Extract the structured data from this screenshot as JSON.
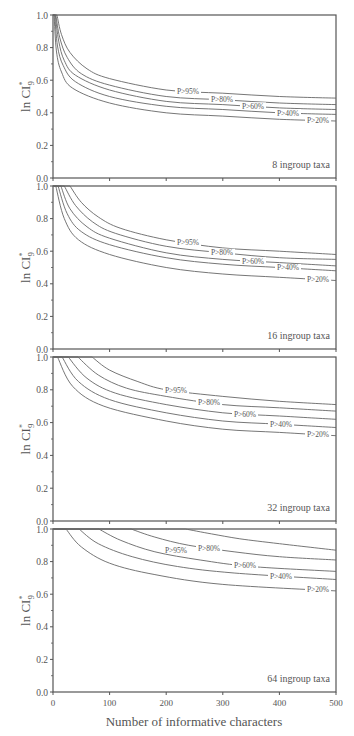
{
  "chart_data": {
    "type": "line",
    "title": "",
    "xlabel": "Number of informative characters",
    "ylabel": "ln CI*9",
    "ylabel_parts": {
      "main": "ln CI",
      "sup": "*",
      "sub": "9"
    },
    "xlim": [
      0,
      500
    ],
    "ylim": [
      0.0,
      1.0
    ],
    "x_ticks": [
      0,
      100,
      200,
      300,
      400,
      500
    ],
    "x_tick_labels": [
      "0",
      "100",
      "200",
      "300",
      "400",
      "500"
    ],
    "y_ticks": [
      0.0,
      0.2,
      0.4,
      0.6,
      0.8,
      1.0
    ],
    "y_tick_labels": [
      "0.0",
      "0.2",
      "0.4",
      "0.6",
      "0.8",
      "1.0"
    ],
    "grid": false,
    "legend_position": "inline labels near right end of curves",
    "panels": [
      {
        "annotation": "8 ingroup taxa",
        "series": [
          {
            "name": "P>95%",
            "x": [
              7,
              15,
              30,
              60,
              100,
              200,
              300,
              400,
              500
            ],
            "values": [
              1.0,
              0.88,
              0.77,
              0.67,
              0.61,
              0.54,
              0.52,
              0.5,
              0.49
            ]
          },
          {
            "name": "P>80%",
            "x": [
              5,
              12,
              25,
              50,
              100,
              200,
              300,
              400,
              500
            ],
            "values": [
              1.0,
              0.86,
              0.74,
              0.64,
              0.57,
              0.5,
              0.48,
              0.46,
              0.45
            ]
          },
          {
            "name": "P>60%",
            "x": [
              4,
              10,
              20,
              40,
              100,
              200,
              300,
              400,
              500
            ],
            "values": [
              1.0,
              0.84,
              0.72,
              0.63,
              0.54,
              0.47,
              0.45,
              0.43,
              0.42
            ]
          },
          {
            "name": "P>40%",
            "x": [
              3,
              8,
              18,
              40,
              100,
              200,
              300,
              400,
              500
            ],
            "values": [
              1.0,
              0.81,
              0.69,
              0.59,
              0.5,
              0.44,
              0.42,
              0.4,
              0.39
            ]
          },
          {
            "name": "P>20%",
            "x": [
              2,
              6,
              15,
              35,
              100,
              200,
              300,
              400,
              500
            ],
            "values": [
              1.0,
              0.78,
              0.65,
              0.55,
              0.46,
              0.4,
              0.38,
              0.36,
              0.35
            ]
          }
        ]
      },
      {
        "annotation": "16 ingroup taxa",
        "series": [
          {
            "name": "P>95%",
            "x": [
              30,
              50,
              80,
              120,
              200,
              300,
              400,
              500
            ],
            "values": [
              1.0,
              0.9,
              0.81,
              0.74,
              0.67,
              0.62,
              0.6,
              0.58
            ]
          },
          {
            "name": "P>80%",
            "x": [
              20,
              40,
              70,
              110,
              200,
              300,
              400,
              500
            ],
            "values": [
              1.0,
              0.88,
              0.78,
              0.71,
              0.63,
              0.59,
              0.56,
              0.55
            ]
          },
          {
            "name": "P>60%",
            "x": [
              14,
              30,
              60,
              100,
              200,
              300,
              400,
              500
            ],
            "values": [
              1.0,
              0.86,
              0.75,
              0.68,
              0.59,
              0.55,
              0.53,
              0.51
            ]
          },
          {
            "name": "P>40%",
            "x": [
              9,
              25,
              50,
              100,
              200,
              300,
              400,
              500
            ],
            "values": [
              1.0,
              0.83,
              0.72,
              0.64,
              0.56,
              0.52,
              0.5,
              0.48
            ]
          },
          {
            "name": "P>20%",
            "x": [
              5,
              20,
              45,
              100,
              200,
              300,
              400,
              500
            ],
            "values": [
              1.0,
              0.8,
              0.67,
              0.58,
              0.5,
              0.46,
              0.44,
              0.42
            ]
          }
        ]
      },
      {
        "annotation": "32 ingroup taxa",
        "series": [
          {
            "name": "P>95%",
            "x": [
              69,
              100,
              150,
              200,
              300,
              400,
              500
            ],
            "values": [
              1.0,
              0.92,
              0.85,
              0.8,
              0.76,
              0.73,
              0.71
            ]
          },
          {
            "name": "P>80%",
            "x": [
              44,
              80,
              130,
              200,
              300,
              400,
              500
            ],
            "values": [
              1.0,
              0.89,
              0.81,
              0.76,
              0.71,
              0.69,
              0.67
            ]
          },
          {
            "name": "P>60%",
            "x": [
              27,
              60,
              110,
              200,
              300,
              400,
              500
            ],
            "values": [
              1.0,
              0.87,
              0.78,
              0.71,
              0.66,
              0.64,
              0.62
            ]
          },
          {
            "name": "P>40%",
            "x": [
              16,
              45,
              100,
              200,
              300,
              400,
              500
            ],
            "values": [
              1.0,
              0.85,
              0.74,
              0.66,
              0.61,
              0.59,
              0.57
            ]
          },
          {
            "name": "P>20%",
            "x": [
              8,
              35,
              90,
              200,
              300,
              400,
              500
            ],
            "values": [
              1.0,
              0.82,
              0.7,
              0.61,
              0.56,
              0.54,
              0.52
            ]
          }
        ]
      },
      {
        "annotation": "64 ingroup taxa",
        "series": [
          {
            "name": "P>95%",
            "x": [
              234,
              280,
              330,
              400,
              500
            ],
            "values": [
              1.0,
              0.97,
              0.94,
              0.91,
              0.87
            ]
          },
          {
            "name": "P>80%",
            "x": [
              138,
              180,
              240,
              320,
              400,
              500
            ],
            "values": [
              1.0,
              0.95,
              0.9,
              0.86,
              0.83,
              0.81
            ]
          },
          {
            "name": "P>60%",
            "x": [
              81,
              120,
              180,
              260,
              350,
              500
            ],
            "values": [
              1.0,
              0.93,
              0.86,
              0.81,
              0.77,
              0.74
            ]
          },
          {
            "name": "P>40%",
            "x": [
              46,
              80,
              140,
              220,
              320,
              500
            ],
            "values": [
              1.0,
              0.91,
              0.83,
              0.77,
              0.73,
              0.69
            ]
          },
          {
            "name": "P>20%",
            "x": [
              23,
              50,
              100,
              180,
              300,
              500
            ],
            "values": [
              1.0,
              0.89,
              0.79,
              0.72,
              0.66,
              0.62
            ]
          }
        ]
      }
    ]
  },
  "colors": {
    "axis": "#555555",
    "line": "#666666",
    "text": "#555555",
    "background": "#ffffff"
  }
}
